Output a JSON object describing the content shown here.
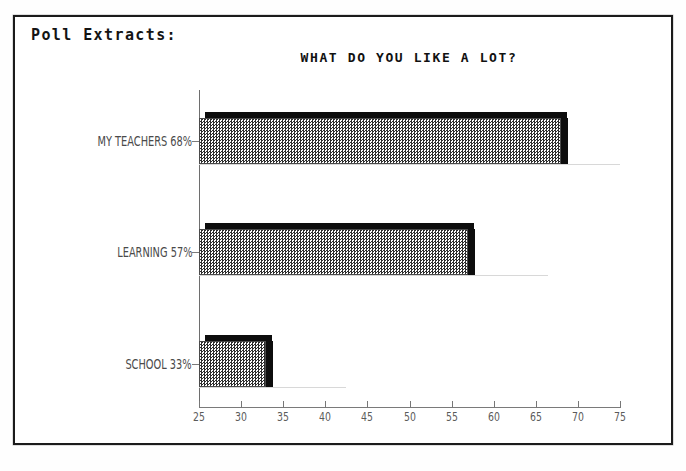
{
  "page": {
    "header_label": "Poll Extracts:"
  },
  "chart_data": {
    "type": "bar",
    "orientation": "horizontal",
    "title": "WHAT DO YOU LIKE A LOT?",
    "xlabel": "",
    "ylabel": "",
    "categories": [
      "MY TEACHERS 68%",
      "LEARNING 57%",
      "SCHOOL 33%"
    ],
    "values": [
      68,
      57,
      33
    ],
    "bar_labels": [
      "MY TEACHERS 68%",
      "LEARNING 57%",
      "SCHOOL 33%"
    ],
    "xlim": [
      25,
      75
    ],
    "xticks": [
      25,
      30,
      35,
      40,
      45,
      50,
      55,
      60,
      65,
      70,
      75
    ],
    "xtick_labels": [
      "25",
      "30",
      "35",
      "40",
      "45",
      "50",
      "55",
      "60",
      "65",
      "70",
      "75"
    ],
    "grid": false,
    "legend": false,
    "bar_fill": "#808080",
    "bar_edge": "#0d0d0d",
    "background": "#ffffff"
  }
}
